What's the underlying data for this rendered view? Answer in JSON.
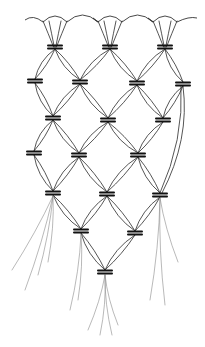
{
  "figure": {
    "stroke_color": "#2a2a2a",
    "knot_color": "#111111",
    "background": "#ffffff"
  },
  "top_edge": {
    "x_start": 25,
    "x_end": 197,
    "y": 18,
    "anchor_xs": [
      55,
      110,
      165
    ]
  },
  "knots": [
    {
      "row": 1,
      "x": 55,
      "y": 47
    },
    {
      "row": 1,
      "x": 110,
      "y": 47
    },
    {
      "row": 1,
      "x": 165,
      "y": 47
    },
    {
      "row": 2,
      "x": 35,
      "y": 81
    },
    {
      "row": 2,
      "x": 80,
      "y": 82
    },
    {
      "row": 2,
      "x": 137,
      "y": 83
    },
    {
      "row": 2,
      "x": 183,
      "y": 84
    },
    {
      "row": 3,
      "x": 53,
      "y": 118
    },
    {
      "row": 3,
      "x": 108,
      "y": 120
    },
    {
      "row": 3,
      "x": 163,
      "y": 120
    },
    {
      "row": 4,
      "x": 34,
      "y": 153
    },
    {
      "row": 4,
      "x": 79,
      "y": 155
    },
    {
      "row": 4,
      "x": 138,
      "y": 155
    },
    {
      "row": 5,
      "x": 53,
      "y": 193
    },
    {
      "row": 5,
      "x": 107,
      "y": 194
    },
    {
      "row": 5,
      "x": 160,
      "y": 195
    },
    {
      "row": 6,
      "x": 81,
      "y": 231
    },
    {
      "row": 6,
      "x": 135,
      "y": 233
    },
    {
      "row": 7,
      "x": 105,
      "y": 272
    }
  ],
  "right_edge_curve": {
    "from": [
      183,
      84
    ],
    "to": [
      160,
      195
    ],
    "bulge_x": 190
  },
  "tassels": [
    {
      "from": [
        53,
        193
      ],
      "ends": [
        [
          12,
          270
        ],
        [
          25,
          290
        ],
        [
          38,
          275
        ],
        [
          48,
          262
        ]
      ]
    },
    {
      "from": [
        81,
        231
      ],
      "ends": [
        [
          70,
          310
        ],
        [
          78,
          300
        ]
      ]
    },
    {
      "from": [
        105,
        272
      ],
      "ends": [
        [
          88,
          330
        ],
        [
          100,
          335
        ],
        [
          112,
          335
        ],
        [
          118,
          325
        ]
      ]
    },
    {
      "from": [
        160,
        195
      ],
      "ends": [
        [
          150,
          300
        ],
        [
          165,
          305
        ],
        [
          178,
          262
        ]
      ]
    }
  ]
}
